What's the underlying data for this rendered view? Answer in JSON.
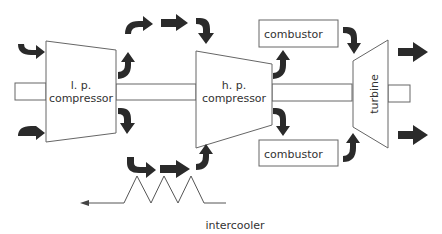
{
  "diagram": {
    "components": {
      "lp_compressor": {
        "line1": "l. p.",
        "line2": "compressor"
      },
      "hp_compressor": {
        "line1": "h. p.",
        "line2": "compressor"
      },
      "combustor_top": {
        "label": "combustor"
      },
      "combustor_bottom": {
        "label": "combustor"
      },
      "turbine": {
        "label": "turbine"
      },
      "intercooler": {
        "label": "intercooler"
      }
    },
    "colors": {
      "arrow": "#2a2a2a",
      "outline": "#666666",
      "text": "#333333",
      "background": "#ffffff"
    }
  }
}
